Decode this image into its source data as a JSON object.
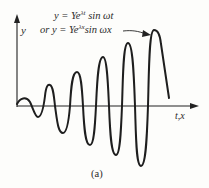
{
  "figure": {
    "caption": "(a)",
    "axes": {
      "y_label": "y",
      "x_label": "t,x"
    },
    "equations": {
      "line1": {
        "prefix": "y = Ye",
        "exponent": "λt",
        "suffix": " sin  ωt"
      },
      "line2": {
        "prefix": "or y = Ye",
        "exponent": "λx",
        "suffix": "sin  ωx"
      }
    },
    "colors": {
      "stroke": "#1e1e1e",
      "background": "#fdfdfb",
      "text": "#2a2a2a"
    },
    "curve_description": "exponentially growing sinusoid"
  }
}
